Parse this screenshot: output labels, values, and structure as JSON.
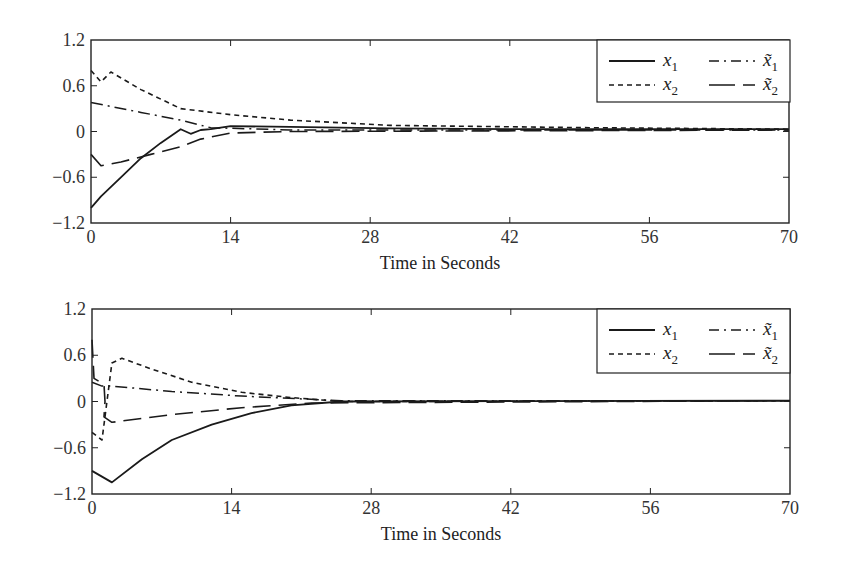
{
  "chart_data": [
    {
      "type": "line",
      "title": "",
      "xlabel": "Time in Seconds",
      "ylabel": "",
      "xlim": [
        0,
        70
      ],
      "ylim": [
        -1.2,
        1.2
      ],
      "xticks": [
        "0",
        "14",
        "28",
        "42",
        "56",
        "70"
      ],
      "yticks": [
        "1.2",
        "0.6",
        "0",
        "-0.6",
        "-1.2"
      ],
      "grid": false,
      "legend_position": "upper right",
      "series": [
        {
          "name": "x1",
          "style": "solid",
          "x": [
            0,
            1,
            3,
            5,
            7,
            9,
            10,
            11,
            12,
            14,
            20,
            30,
            45,
            70
          ],
          "values": [
            -1.0,
            -0.85,
            -0.6,
            -0.35,
            -0.15,
            0.03,
            -0.03,
            0.02,
            0.03,
            0.07,
            0.06,
            0.04,
            0.03,
            0.03
          ]
        },
        {
          "name": "x2",
          "style": "dotted",
          "x": [
            0,
            1,
            2,
            5,
            9,
            14,
            20,
            30,
            50,
            70
          ],
          "values": [
            0.8,
            0.65,
            0.78,
            0.55,
            0.3,
            0.22,
            0.15,
            0.08,
            0.05,
            0.03
          ]
        },
        {
          "name": "x~1",
          "style": "dash-dot",
          "x": [
            0,
            5,
            9,
            12,
            20,
            70
          ],
          "values": [
            0.38,
            0.25,
            0.15,
            0.05,
            0.02,
            0.02
          ]
        },
        {
          "name": "x~2",
          "style": "long-dash",
          "x": [
            0,
            1,
            3,
            6,
            9,
            11,
            14,
            20,
            70
          ],
          "values": [
            -0.3,
            -0.45,
            -0.4,
            -0.3,
            -0.2,
            -0.1,
            -0.02,
            0.0,
            0.02
          ]
        }
      ]
    },
    {
      "type": "line",
      "title": "",
      "xlabel": "Time in Seconds",
      "ylabel": "",
      "xlim": [
        0,
        70
      ],
      "ylim": [
        -1.2,
        1.2
      ],
      "xticks": [
        "0",
        "14",
        "28",
        "42",
        "56",
        "70"
      ],
      "yticks": [
        "1.2",
        "0.6",
        "0",
        "-0.6",
        "-1.2"
      ],
      "grid": false,
      "legend_position": "upper right",
      "series": [
        {
          "name": "x1",
          "style": "solid",
          "x": [
            0,
            2,
            5,
            8,
            12,
            16,
            20,
            25,
            70
          ],
          "values": [
            -0.9,
            -1.05,
            -0.75,
            -0.5,
            -0.3,
            -0.15,
            -0.05,
            0.0,
            0.01
          ]
        },
        {
          "name": "x2",
          "style": "dotted",
          "x": [
            0,
            1,
            2,
            3,
            6,
            10,
            15,
            20,
            25,
            70
          ],
          "values": [
            -0.4,
            -0.5,
            0.5,
            0.56,
            0.42,
            0.25,
            0.12,
            0.05,
            0.0,
            0.01
          ]
        },
        {
          "name": "x~1",
          "style": "dash-dot",
          "x": [
            0,
            1,
            2,
            8,
            15,
            25,
            70
          ],
          "values": [
            0.25,
            0.2,
            0.2,
            0.13,
            0.07,
            0.01,
            0.01
          ]
        },
        {
          "name": "x~2",
          "style": "long-dash",
          "x": [
            0,
            0.2,
            1.2,
            1.3,
            1.2,
            2,
            8,
            15,
            22,
            70
          ],
          "values": [
            0.8,
            0.3,
            0.22,
            0.0,
            -0.2,
            -0.27,
            -0.17,
            -0.08,
            -0.02,
            0.01
          ]
        }
      ]
    }
  ],
  "legend": {
    "x1": "x",
    "x1_sub": "1",
    "x2": "x",
    "x2_sub": "2",
    "xt1": "x̃",
    "xt1_sub": "1",
    "xt2": "x̃",
    "xt2_sub": "2"
  },
  "xlabel": "Time in Seconds"
}
